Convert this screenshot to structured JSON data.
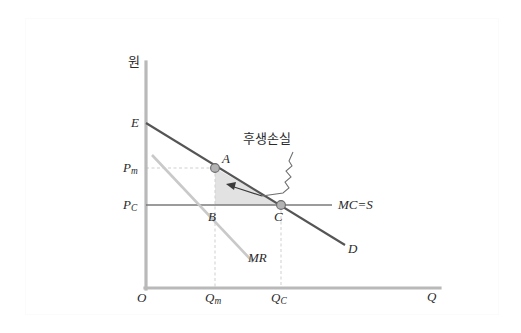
{
  "figure": {
    "title_kr_note": "후생손실",
    "axes": {
      "y_axis_label": "원",
      "x_axis_label": "Q",
      "origin_label": "O"
    },
    "price_ticks": [
      {
        "id": "pm",
        "base": "P",
        "sub": "m",
        "value_y": 168
      },
      {
        "id": "pc",
        "base": "P",
        "sub": "C",
        "value_y": 205
      }
    ],
    "quantity_ticks": [
      {
        "id": "qm",
        "base": "Q",
        "sub": "m",
        "value_x": 215
      },
      {
        "id": "qc",
        "base": "Q",
        "sub": "C",
        "value_x": 281
      }
    ],
    "points": [
      {
        "id": "E",
        "label": "E",
        "x": 146,
        "y": 123,
        "marker": false
      },
      {
        "id": "A",
        "label": "A",
        "x": 215,
        "y": 168,
        "marker": true
      },
      {
        "id": "B",
        "label": "B",
        "x": 215,
        "y": 205,
        "marker": false
      },
      {
        "id": "C",
        "label": "C",
        "x": 281,
        "y": 205,
        "marker": true
      }
    ],
    "curves": [
      {
        "id": "demand",
        "label": "D",
        "color": "#555555"
      },
      {
        "id": "marginal-revenue",
        "label": "MR",
        "color": "#c8c8c8"
      },
      {
        "id": "marginal-cost-supply",
        "label": "MC=S",
        "color": "#777777"
      }
    ],
    "annotation": {
      "text": "후생손실",
      "target": "deadweight-loss-triangle"
    },
    "colors": {
      "axis": "#b9b9b9",
      "demand": "#555555",
      "mr": "#c9c9c9",
      "mc": "#7a7a7a",
      "dashed": "#cfcfcf",
      "triangle_fill": "#e2e2e2",
      "marker_fill": "#b0b0b0",
      "marker_stroke": "#6b6b6b",
      "text": "#2b2b2b",
      "frame": "#fbfbfb"
    }
  }
}
